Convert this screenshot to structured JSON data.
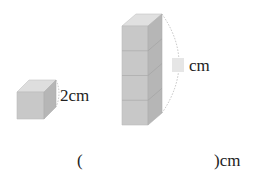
{
  "small_cube": {
    "edge_label": "2cm"
  },
  "tower": {
    "cube_count": 4,
    "height_label_unit": "cm",
    "height_value": ""
  },
  "answer": {
    "open_paren": "(",
    "close_paren_unit": ")cm",
    "value": ""
  },
  "colors": {
    "cube_front": "#c8c8c8",
    "cube_top": "#dedede",
    "cube_side": "#b4b4b4",
    "blank_box": "#e6e6e6"
  }
}
